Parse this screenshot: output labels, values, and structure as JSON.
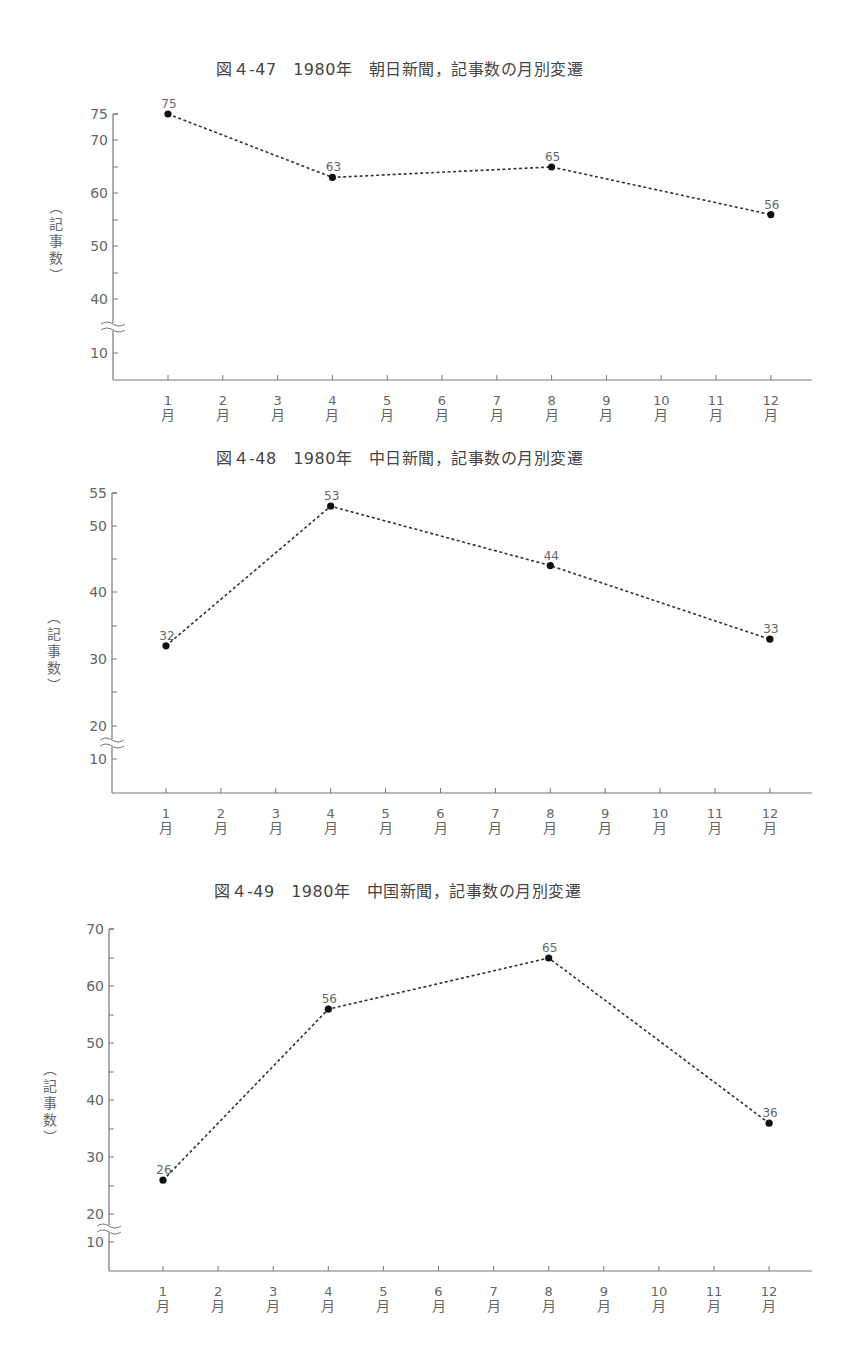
{
  "chart_data": [
    {
      "type": "line",
      "title": "図４-47　1980年　朝日新聞，記事数の月別変遷",
      "xlabel": "",
      "ylabel": "（記事数）",
      "categories": [
        "1月",
        "2月",
        "3月",
        "4月",
        "5月",
        "6月",
        "7月",
        "8月",
        "9月",
        "10月",
        "11月",
        "12月"
      ],
      "points": [
        {
          "month": 1,
          "value": 75
        },
        {
          "month": 4,
          "value": 63
        },
        {
          "month": 8,
          "value": 65
        },
        {
          "month": 12,
          "value": 56
        }
      ],
      "y_ticks_labeled": [
        10,
        40,
        50,
        60,
        70,
        75
      ],
      "y_axis_break": "between 10 and 40",
      "ylim": [
        5,
        75
      ],
      "line_style": "dotted",
      "grid": false
    },
    {
      "type": "line",
      "title": "図４-48　1980年　中日新聞，記事数の月別変遷",
      "xlabel": "",
      "ylabel": "（記事数）",
      "categories": [
        "1月",
        "2月",
        "3月",
        "4月",
        "5月",
        "6月",
        "7月",
        "8月",
        "9月",
        "10月",
        "11月",
        "12月"
      ],
      "points": [
        {
          "month": 1,
          "value": 32
        },
        {
          "month": 4,
          "value": 53
        },
        {
          "month": 8,
          "value": 44
        },
        {
          "month": 12,
          "value": 33
        }
      ],
      "y_ticks_labeled": [
        10,
        20,
        30,
        40,
        50,
        55
      ],
      "y_axis_break": "between 10 and 20",
      "ylim": [
        5,
        55
      ],
      "line_style": "dotted",
      "grid": false
    },
    {
      "type": "line",
      "title": "図４-49　1980年　中国新聞，記事数の月別変遷",
      "xlabel": "",
      "ylabel": "（記事数）",
      "categories": [
        "1月",
        "2月",
        "3月",
        "4月",
        "5月",
        "6月",
        "7月",
        "8月",
        "9月",
        "10月",
        "11月",
        "12月"
      ],
      "points": [
        {
          "month": 1,
          "value": 26
        },
        {
          "month": 4,
          "value": 56
        },
        {
          "month": 8,
          "value": 65
        },
        {
          "month": 12,
          "value": 36
        }
      ],
      "y_ticks_labeled": [
        10,
        20,
        30,
        40,
        50,
        60,
        70
      ],
      "y_axis_break": "between 10 and 20",
      "ylim": [
        5,
        70
      ],
      "line_style": "dotted",
      "grid": false
    }
  ],
  "layout": {
    "charts": [
      {
        "title_pos": [
          216,
          66
        ],
        "axis_x": 113,
        "x_end": 812,
        "baseline_y": 380,
        "month_x0": 168,
        "month_dx": 54.8,
        "y_map": [
          {
            "v": 75,
            "y": 114
          },
          {
            "v": 70,
            "y": 140
          },
          {
            "v": 65,
            "y": 167
          },
          {
            "v": 60,
            "y": 193
          },
          {
            "v": 55,
            "y": 220
          },
          {
            "v": 50,
            "y": 246
          },
          {
            "v": 45,
            "y": 273
          },
          {
            "v": 40,
            "y": 299
          }
        ],
        "low_map": [
          {
            "v": 10,
            "y": 353
          }
        ],
        "break_y": 326,
        "label_ticks": [
          75,
          70,
          60,
          50,
          40
        ],
        "minor_ticks": [
          65,
          55,
          45
        ],
        "low_label_ticks": [
          10
        ],
        "ylabel_pos": [
          56,
          246
        ]
      },
      {
        "title_pos": [
          216,
          455
        ],
        "axis_x": 112,
        "x_end": 812,
        "baseline_y": 793,
        "month_x0": 166,
        "month_dx": 54.9,
        "y_map": [
          {
            "v": 55,
            "y": 493
          },
          {
            "v": 50,
            "y": 526
          },
          {
            "v": 45,
            "y": 559
          },
          {
            "v": 40,
            "y": 592
          },
          {
            "v": 35,
            "y": 626
          },
          {
            "v": 30,
            "y": 659
          },
          {
            "v": 25,
            "y": 692
          },
          {
            "v": 20,
            "y": 726
          }
        ],
        "low_map": [
          {
            "v": 10,
            "y": 759
          }
        ],
        "break_y": 742,
        "label_ticks": [
          55,
          50,
          40,
          30,
          20
        ],
        "minor_ticks": [
          45,
          35,
          25
        ],
        "low_label_ticks": [
          10
        ],
        "ylabel_pos": [
          54,
          656
        ]
      },
      {
        "title_pos": [
          214,
          888
        ],
        "axis_x": 109,
        "x_end": 812,
        "baseline_y": 1271,
        "month_x0": 163,
        "month_dx": 55.1,
        "y_map": [
          {
            "v": 70,
            "y": 929
          },
          {
            "v": 65,
            "y": 958
          },
          {
            "v": 60,
            "y": 986
          },
          {
            "v": 55,
            "y": 1015
          },
          {
            "v": 50,
            "y": 1043
          },
          {
            "v": 45,
            "y": 1072
          },
          {
            "v": 40,
            "y": 1100
          },
          {
            "v": 35,
            "y": 1129
          },
          {
            "v": 30,
            "y": 1157
          },
          {
            "v": 25,
            "y": 1186
          },
          {
            "v": 20,
            "y": 1214
          }
        ],
        "low_map": [
          {
            "v": 10,
            "y": 1242
          }
        ],
        "break_y": 1228,
        "label_ticks": [
          70,
          60,
          50,
          40,
          30,
          20
        ],
        "minor_ticks": [
          65,
          55,
          45,
          35,
          25
        ],
        "low_label_ticks": [
          10
        ],
        "ylabel_pos": [
          50,
          1108
        ]
      }
    ]
  },
  "colors": {
    "axis": "#777777",
    "line": "#333333",
    "marker": "#111111",
    "text": "#666666"
  }
}
